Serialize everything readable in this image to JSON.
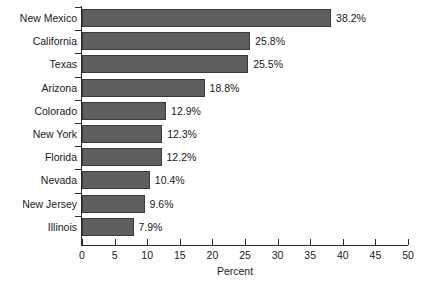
{
  "chart_data": {
    "type": "bar",
    "orientation": "horizontal",
    "title": "",
    "xlabel": "Percent",
    "ylabel": "",
    "xlim": [
      0,
      50
    ],
    "xticks": [
      0,
      5,
      10,
      15,
      20,
      25,
      30,
      35,
      40,
      45,
      50
    ],
    "grid": false,
    "legend": false,
    "categories": [
      "New Mexico",
      "California",
      "Texas",
      "Arizona",
      "Colorado",
      "New York",
      "Florida",
      "Nevada",
      "New Jersey",
      "Illinois"
    ],
    "values": [
      38.2,
      25.8,
      25.5,
      18.8,
      12.9,
      12.3,
      12.2,
      10.4,
      9.6,
      7.9
    ],
    "value_labels": [
      "38.2%",
      "25.8%",
      "25.5%",
      "18.8%",
      "12.9%",
      "12.3%",
      "12.2%",
      "10.4%",
      "9.6%",
      "7.9%"
    ],
    "tick_labels": [
      "0",
      "5",
      "10",
      "15",
      "20",
      "25",
      "30",
      "35",
      "40",
      "45",
      "50"
    ],
    "colors": {
      "bar_fill": "#5f5f5f",
      "bar_stroke": "#3a3a3a",
      "axis": "#2a2a2a",
      "text": "#1a1a1a",
      "background": "#ffffff"
    }
  }
}
